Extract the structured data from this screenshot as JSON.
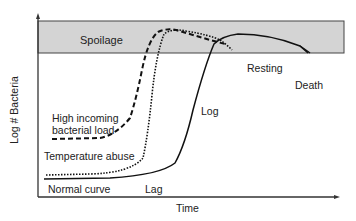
{
  "diagram": {
    "axes": {
      "x_label": "Time",
      "y_label": "Log # Bacteria"
    },
    "band": {
      "label": "Spoilage",
      "fill": "#d4d4d4"
    },
    "curves": [
      {
        "name": "Normal curve",
        "style": "solid"
      },
      {
        "name": "Temperature abuse",
        "style": "dotted"
      },
      {
        "name": "High incoming bacterial load",
        "style": "dashed"
      }
    ],
    "phase_labels": {
      "lag": "Lag",
      "log": "Log",
      "resting": "Resting",
      "death": "Death"
    },
    "curve_labels": {
      "normal": "Normal curve",
      "temperature": "Temperature abuse",
      "high_load_line1": "High incoming",
      "high_load_line2": "bacterial load"
    }
  }
}
